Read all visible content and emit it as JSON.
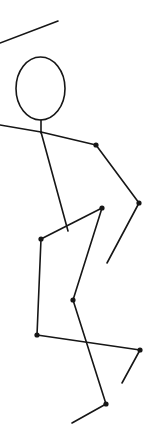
{
  "scene": {
    "title": "Stick Figure Pose",
    "width": 157,
    "height": 441,
    "background_color": "#ffffff",
    "stroke_color": "#161616",
    "joint_color": "#161616",
    "stroke_width": 1.6,
    "joint_radius": 2.6
  },
  "chart_data": {
    "type": "scatter",
    "xlabel": "",
    "ylabel": "",
    "xlim": [
      0,
      157
    ],
    "ylim": [
      441,
      0
    ],
    "grid": false,
    "legend": "none",
    "head": {
      "label": "head",
      "cx": 40.5,
      "cy": 88.5,
      "rx": 24.5,
      "ry": 31.5
    },
    "joints": [
      {
        "name": "shoulder",
        "x": 96,
        "y": 145
      },
      {
        "name": "elbow",
        "x": 139,
        "y": 203
      },
      {
        "name": "hip-right",
        "x": 102,
        "y": 208
      },
      {
        "name": "hip-left",
        "x": 41,
        "y": 239
      },
      {
        "name": "knee-right",
        "x": 73,
        "y": 300
      },
      {
        "name": "knee-left",
        "x": 37,
        "y": 335
      },
      {
        "name": "ankle-left",
        "x": 140,
        "y": 350
      },
      {
        "name": "ankle-right",
        "x": 106,
        "y": 404
      }
    ],
    "bones": [
      {
        "name": "upper-limb-top",
        "x1": 0,
        "y1": 43,
        "x2": 58,
        "y2": 21
      },
      {
        "name": "arm-left-upper",
        "x1": 0,
        "y1": 125,
        "x2": 41,
        "y2": 132
      },
      {
        "name": "neck",
        "x1": 41,
        "y1": 120,
        "x2": 41,
        "y2": 133
      },
      {
        "name": "clavicle",
        "x1": 41,
        "y1": 132,
        "x2": 96,
        "y2": 145
      },
      {
        "name": "arm-upper-right",
        "x1": 96,
        "y1": 145,
        "x2": 139,
        "y2": 203
      },
      {
        "name": "forearm-right",
        "x1": 139,
        "y1": 203,
        "x2": 107,
        "y2": 263
      },
      {
        "name": "spine",
        "x1": 41,
        "y1": 132,
        "x2": 68,
        "y2": 231
      },
      {
        "name": "pelvis",
        "x1": 41,
        "y1": 239,
        "x2": 102,
        "y2": 208
      },
      {
        "name": "thigh-right",
        "x1": 102,
        "y1": 208,
        "x2": 73,
        "y2": 300
      },
      {
        "name": "shin-right",
        "x1": 73,
        "y1": 300,
        "x2": 106,
        "y2": 404
      },
      {
        "name": "foot-right",
        "x1": 106,
        "y1": 404,
        "x2": 72,
        "y2": 423
      },
      {
        "name": "thigh-left",
        "x1": 41,
        "y1": 239,
        "x2": 37,
        "y2": 335
      },
      {
        "name": "shin-left",
        "x1": 37,
        "y1": 335,
        "x2": 140,
        "y2": 350
      },
      {
        "name": "foot-left",
        "x1": 140,
        "y1": 350,
        "x2": 122,
        "y2": 383
      }
    ]
  }
}
